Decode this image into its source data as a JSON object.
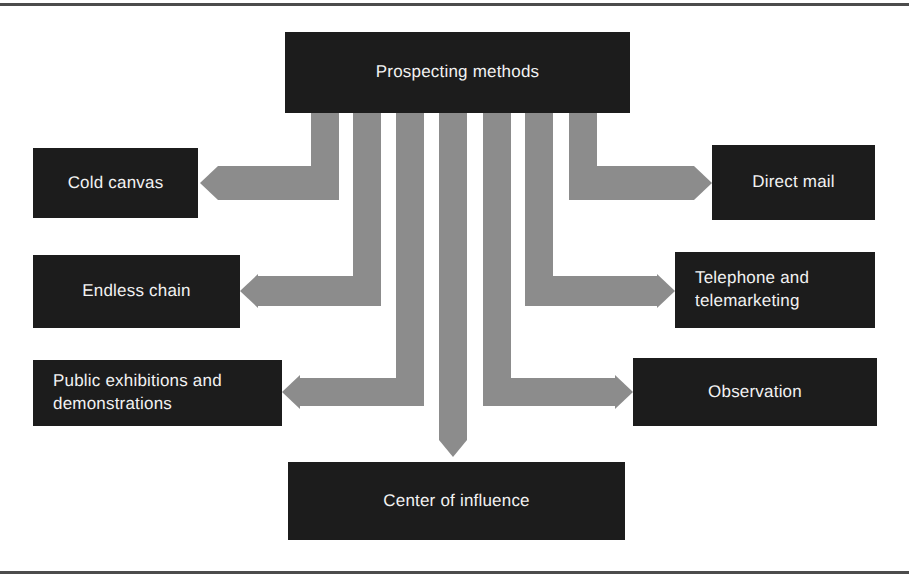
{
  "diagram": {
    "type": "hub-and-spoke",
    "title_node": {
      "label": "Prospecting methods"
    },
    "branches": [
      {
        "label": "Cold canvas",
        "side": "left",
        "order": 1
      },
      {
        "label": "Endless chain",
        "side": "left",
        "order": 2
      },
      {
        "label": "Public exhibitions and\ndemonstrations",
        "side": "left",
        "order": 3
      },
      {
        "label": "Center of influence",
        "side": "bottom",
        "order": 4
      },
      {
        "label": "Observation",
        "side": "right",
        "order": 5
      },
      {
        "label": "Telephone and\ntelemarketing",
        "side": "right",
        "order": 6
      },
      {
        "label": "Direct mail",
        "side": "right",
        "order": 7
      }
    ],
    "colors": {
      "node_fill": "#1c1c1c",
      "node_text": "#f2f2f2",
      "connector": "#8c8c8c",
      "rule": "#4c4c4c",
      "background": "#ffffff"
    }
  }
}
